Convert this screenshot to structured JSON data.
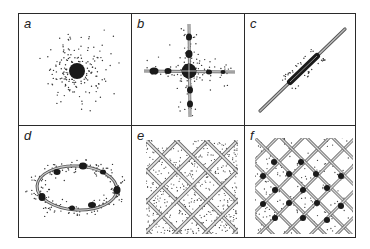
{
  "figure": {
    "panels": [
      {
        "id": "a",
        "label": "a",
        "description": "point defect: dense central particle with surrounding dispersed dots"
      },
      {
        "id": "b",
        "label": "b",
        "description": "cross of two lines with central large particle and beads along arms, dots clustered"
      },
      {
        "id": "c",
        "label": "c",
        "description": "single diagonal line with dark elongated segment and dots around it"
      },
      {
        "id": "d",
        "label": "d",
        "description": "closed elliptical loop with beads and surrounding dots"
      },
      {
        "id": "e",
        "label": "e",
        "description": "diagonal lattice network of hatched double lines with uniform dot fill"
      },
      {
        "id": "f",
        "label": "f",
        "description": "diagonal lattice network with dark nodes at intersections and dots clustered at lines"
      }
    ],
    "colors": {
      "ink": "#2a2a2a",
      "line_fill": "#bdbdbd",
      "background": "#ffffff"
    }
  }
}
